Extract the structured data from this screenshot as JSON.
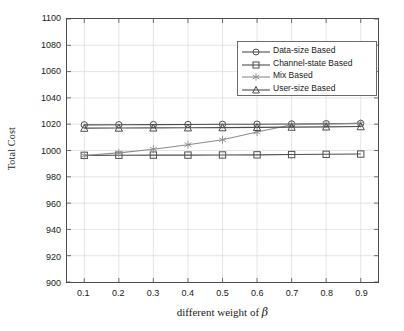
{
  "chart_data": {
    "type": "line",
    "title": "",
    "xlabel": "different weight of β",
    "xlabel_prefix": "different weight of ",
    "xlabel_symbol": "β",
    "ylabel": "Total Cost",
    "x": [
      0.1,
      0.2,
      0.3,
      0.4,
      0.5,
      0.6,
      0.7,
      0.8,
      0.9
    ],
    "xtick_labels": [
      "0.1",
      "0.2",
      "0.3",
      "0.4",
      "0.5",
      "0.6",
      "0.7",
      "0.8",
      "0.9"
    ],
    "ytick_labels": [
      "900",
      "920",
      "940",
      "960",
      "980",
      "1000",
      "1020",
      "1040",
      "1060",
      "1080",
      "1100"
    ],
    "yticks": [
      900,
      920,
      940,
      960,
      980,
      1000,
      1020,
      1040,
      1060,
      1080,
      1100
    ],
    "xlim": [
      0.05,
      0.95
    ],
    "ylim": [
      900,
      1100
    ],
    "grid": true,
    "legend_position": "upper right",
    "series": [
      {
        "name": "Data-size Based",
        "marker": "circle",
        "color": "#4d4d4d",
        "values": [
          1019.5,
          1019.6,
          1019.7,
          1019.8,
          1019.9,
          1020.0,
          1020.2,
          1020.4,
          1020.6
        ]
      },
      {
        "name": "Channel-state Based",
        "marker": "square",
        "color": "#4d4d4d",
        "values": [
          996.3,
          996.4,
          996.5,
          996.5,
          996.6,
          996.7,
          996.9,
          997.1,
          997.3
        ]
      },
      {
        "name": "Mix Based",
        "marker": "star",
        "color": "#8c8c8c",
        "values": [
          996.2,
          998.2,
          1001.0,
          1004.4,
          1008.2,
          1014.0,
          1019.6,
          1020.2,
          1020.6
        ]
      },
      {
        "name": "User-size Based",
        "marker": "triangle",
        "color": "#4d4d4d",
        "values": [
          1017.0,
          1017.1,
          1017.2,
          1017.3,
          1017.4,
          1017.6,
          1017.8,
          1018.0,
          1018.2
        ]
      }
    ]
  },
  "legend": {
    "items": [
      {
        "label": "Data-size Based",
        "marker": "circle"
      },
      {
        "label": "Channel-state Based",
        "marker": "square"
      },
      {
        "label": "Mix Based",
        "marker": "star"
      },
      {
        "label": "User-size Based",
        "marker": "triangle"
      }
    ]
  },
  "colors": {
    "axis": "#4d4d4d",
    "grid": "#d9d9d9",
    "line_dark": "#4d4d4d",
    "line_light": "#8c8c8c",
    "text": "#1a1a1a",
    "background": "#ffffff"
  }
}
